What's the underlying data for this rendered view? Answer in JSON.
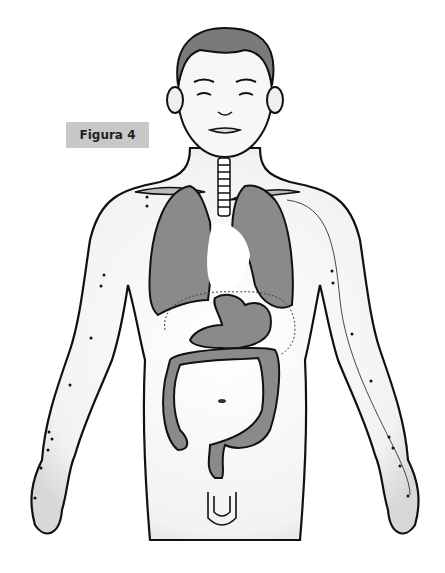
{
  "figure": {
    "label": "Figura 4",
    "organs": [
      "lungs",
      "heart",
      "stomach",
      "colon",
      "trachea"
    ],
    "colors": {
      "organ_fill": "#8a8a8a",
      "hair_fill": "#7a7a7a",
      "outline": "#111111",
      "label_bg": "#c8c8c8"
    }
  }
}
